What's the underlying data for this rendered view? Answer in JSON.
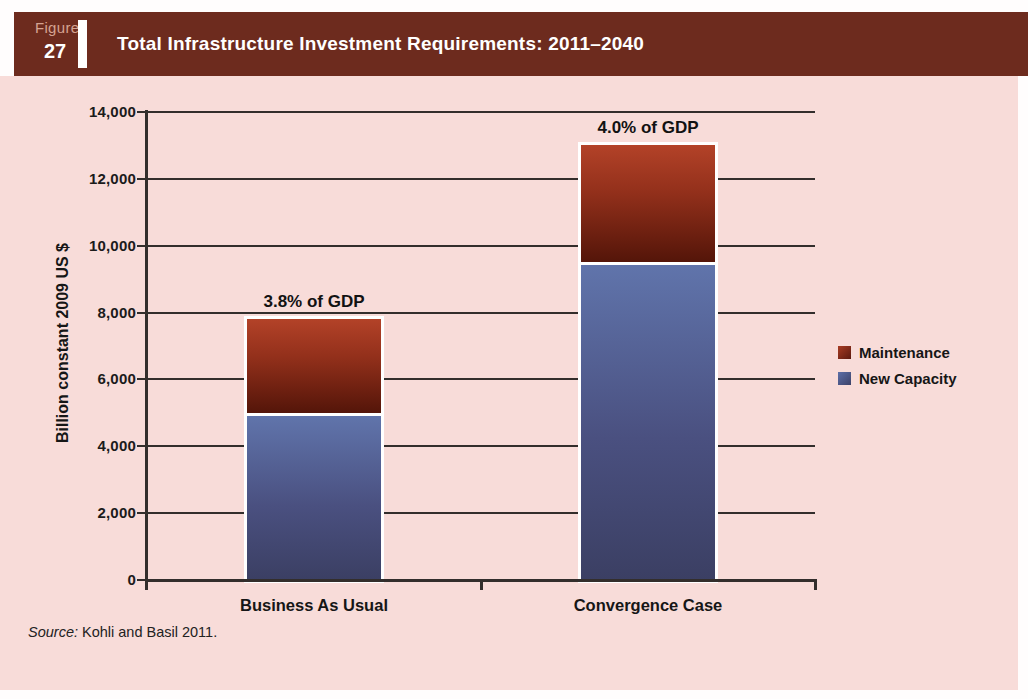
{
  "figure": {
    "kicker": "Figure",
    "number": "27",
    "title": "Total Infrastructure Investment Requirements: 2011–2040"
  },
  "source": {
    "prefix": "Source:",
    "text": " Kohli and Basil 2011."
  },
  "colors": {
    "header_bg": "#6d2b1e",
    "panel_bg": "#f8dcd9",
    "axis": "#332e2c",
    "maintenance_top": "#b34228",
    "maintenance_bottom": "#541509",
    "new_capacity_top": "#6074ab",
    "new_capacity_bottom": "#3b3f63"
  },
  "chart_data": {
    "type": "bar",
    "stacked": true,
    "title": "Total Infrastructure Investment Requirements: 2011–2040",
    "categories": [
      "Business As Usual",
      "Convergence Case"
    ],
    "series": [
      {
        "name": "New Capacity",
        "values": [
          5000,
          9500
        ]
      },
      {
        "name": "Maintenance",
        "values": [
          2800,
          3500
        ]
      }
    ],
    "totals": [
      7800,
      13000
    ],
    "annotations": [
      "3.8% of GDP",
      "4.0% of GDP"
    ],
    "xlabel": "",
    "ylabel": "Billion constant 2009 US $",
    "ylim": [
      0,
      14000
    ],
    "ytick_interval": 2000,
    "ytick_labels": [
      "0",
      "2,000",
      "4,000",
      "6,000",
      "8,000",
      "10,000",
      "12,000",
      "14,000"
    ],
    "grid": true,
    "legend": [
      "Maintenance",
      "New Capacity"
    ],
    "legend_position": "right"
  }
}
